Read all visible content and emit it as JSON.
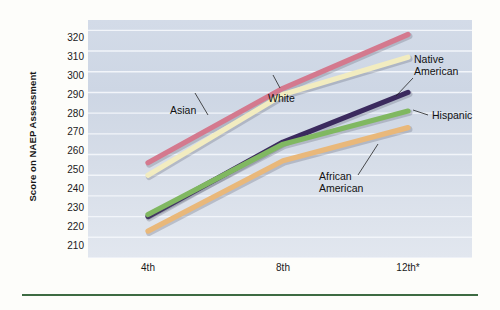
{
  "chart_data": {
    "type": "line",
    "title": "",
    "xlabel": "",
    "ylabel": "Score on NAEP Assessment",
    "categories": [
      "4th",
      "8th",
      "12th*"
    ],
    "ylim": [
      210,
      325
    ],
    "yticks": [
      320,
      310,
      300,
      290,
      280,
      270,
      260,
      250,
      240,
      230,
      220,
      210
    ],
    "grid": "horizontal",
    "legend_position": "inline-annotations",
    "series": [
      {
        "name": "Asian",
        "color": "#d4798e",
        "values": [
          256,
          292,
          318
        ]
      },
      {
        "name": "White",
        "color": "#f2ecc0",
        "values": [
          250,
          289,
          307
        ]
      },
      {
        "name": "Native American",
        "color": "#3b2a5e",
        "values": [
          230,
          266,
          290
        ]
      },
      {
        "name": "Hispanic",
        "color": "#80b861",
        "values": [
          231,
          265,
          281
        ]
      },
      {
        "name": "African American",
        "color": "#e9b87a",
        "values": [
          223,
          257,
          273
        ]
      }
    ],
    "annotations": [
      {
        "text": "Asian",
        "series": "Asian"
      },
      {
        "text": "White",
        "series": "White"
      },
      {
        "text": "Native American",
        "series": "Native American"
      },
      {
        "text": "Hispanic",
        "series": "Hispanic"
      },
      {
        "text": "African American",
        "series": "African American"
      }
    ]
  },
  "axis": {
    "y_title": "Score on NAEP Assessment",
    "y_labels": [
      "320",
      "310",
      "300",
      "290",
      "280",
      "270",
      "260",
      "250",
      "240",
      "230",
      "220",
      "210"
    ],
    "x_labels": [
      "4th",
      "8th",
      "12th*"
    ]
  },
  "labels": {
    "asian": "Asian",
    "white": "White",
    "native_american_line1": "Native",
    "native_american_line2": "American",
    "hispanic": "Hispanic",
    "african_american_line1": "African",
    "african_american_line2": "American"
  },
  "colors": {
    "asian": "#d4798e",
    "white": "#f2ecc0",
    "native_american": "#3b2a5e",
    "hispanic": "#80b861",
    "african_american": "#e9b87a",
    "plot_background": "#d3dbe8",
    "rule": "#3d6b42"
  }
}
